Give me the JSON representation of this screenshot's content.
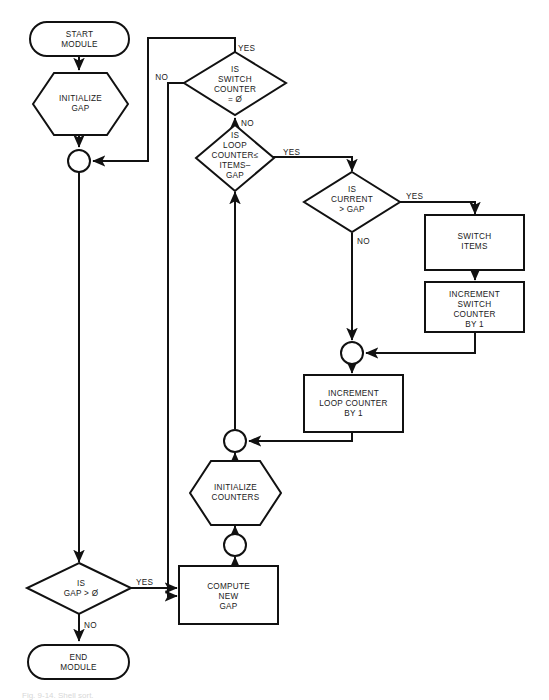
{
  "diagram": {
    "type": "flowchart",
    "background_color": "#ffffff",
    "line_color": "#111111",
    "caption": "Fig. 9-14. Shell sort.",
    "nodes": [
      {
        "id": "start",
        "shape": "terminal",
        "label_lines": [
          "START",
          "MODULE"
        ]
      },
      {
        "id": "init-gap",
        "shape": "hexagon",
        "label_lines": [
          "INITIALIZE",
          "GAP"
        ]
      },
      {
        "id": "conn-a",
        "shape": "connector",
        "label_lines": []
      },
      {
        "id": "switch-counter",
        "shape": "diamond",
        "label_lines": [
          "IS",
          "SWITCH",
          "COUNTER",
          "= Ø"
        ]
      },
      {
        "id": "loop-counter",
        "shape": "diamond",
        "label_lines": [
          "IS",
          "LOOP",
          "COUNTER≤",
          "ITEMS–",
          "GAP"
        ]
      },
      {
        "id": "current-gap",
        "shape": "diamond",
        "label_lines": [
          "IS",
          "CURRENT",
          "> GAP"
        ]
      },
      {
        "id": "switch-items",
        "shape": "process",
        "label_lines": [
          "SWITCH",
          "ITEMS"
        ]
      },
      {
        "id": "inc-switch",
        "shape": "process",
        "label_lines": [
          "INCREMENT",
          "SWITCH",
          "COUNTER",
          "BY 1"
        ]
      },
      {
        "id": "conn-b",
        "shape": "connector",
        "label_lines": []
      },
      {
        "id": "inc-loop",
        "shape": "process",
        "label_lines": [
          "INCREMENT",
          "LOOP COUNTER",
          "BY 1"
        ]
      },
      {
        "id": "conn-c",
        "shape": "connector",
        "label_lines": []
      },
      {
        "id": "init-counters",
        "shape": "hexagon",
        "label_lines": [
          "INITIALIZE",
          "COUNTERS"
        ]
      },
      {
        "id": "conn-d",
        "shape": "connector",
        "label_lines": []
      },
      {
        "id": "gap-positive",
        "shape": "diamond",
        "label_lines": [
          "IS",
          "GAP > Ø"
        ]
      },
      {
        "id": "compute-gap",
        "shape": "process",
        "label_lines": [
          "COMPUTE",
          "NEW",
          "GAP"
        ]
      },
      {
        "id": "end",
        "shape": "terminal",
        "label_lines": [
          "END",
          "MODULE"
        ]
      }
    ],
    "edge_labels": {
      "switch_counter_yes": "YES",
      "switch_counter_no_left": "NO",
      "switch_counter_no_bottom": "NO",
      "loop_counter_yes": "YES",
      "current_gap_yes": "YES",
      "current_gap_no": "NO",
      "gap_positive_yes": "YES",
      "gap_positive_no": "NO"
    },
    "node_text": {
      "start_1": "START",
      "start_2": "MODULE",
      "init_gap_1": "INITIALIZE",
      "init_gap_2": "GAP",
      "switch_counter_1": "IS",
      "switch_counter_2": "SWITCH",
      "switch_counter_3": "COUNTER",
      "switch_counter_4": "= Ø",
      "loop_counter_1": "IS",
      "loop_counter_2": "LOOP",
      "loop_counter_3": "COUNTER≤",
      "loop_counter_4": "ITEMS–",
      "loop_counter_5": "GAP",
      "current_gap_1": "IS",
      "current_gap_2": "CURRENT",
      "current_gap_3": "> GAP",
      "switch_items_1": "SWITCH",
      "switch_items_2": "ITEMS",
      "inc_switch_1": "INCREMENT",
      "inc_switch_2": "SWITCH",
      "inc_switch_3": "COUNTER",
      "inc_switch_4": "BY 1",
      "inc_loop_1": "INCREMENT",
      "inc_loop_2": "LOOP COUNTER",
      "inc_loop_3": "BY 1",
      "init_counters_1": "INITIALIZE",
      "init_counters_2": "COUNTERS",
      "gap_positive_1": "IS",
      "gap_positive_2": "GAP > Ø",
      "compute_gap_1": "COMPUTE",
      "compute_gap_2": "NEW",
      "compute_gap_3": "GAP",
      "end_1": "END",
      "end_2": "MODULE"
    }
  }
}
